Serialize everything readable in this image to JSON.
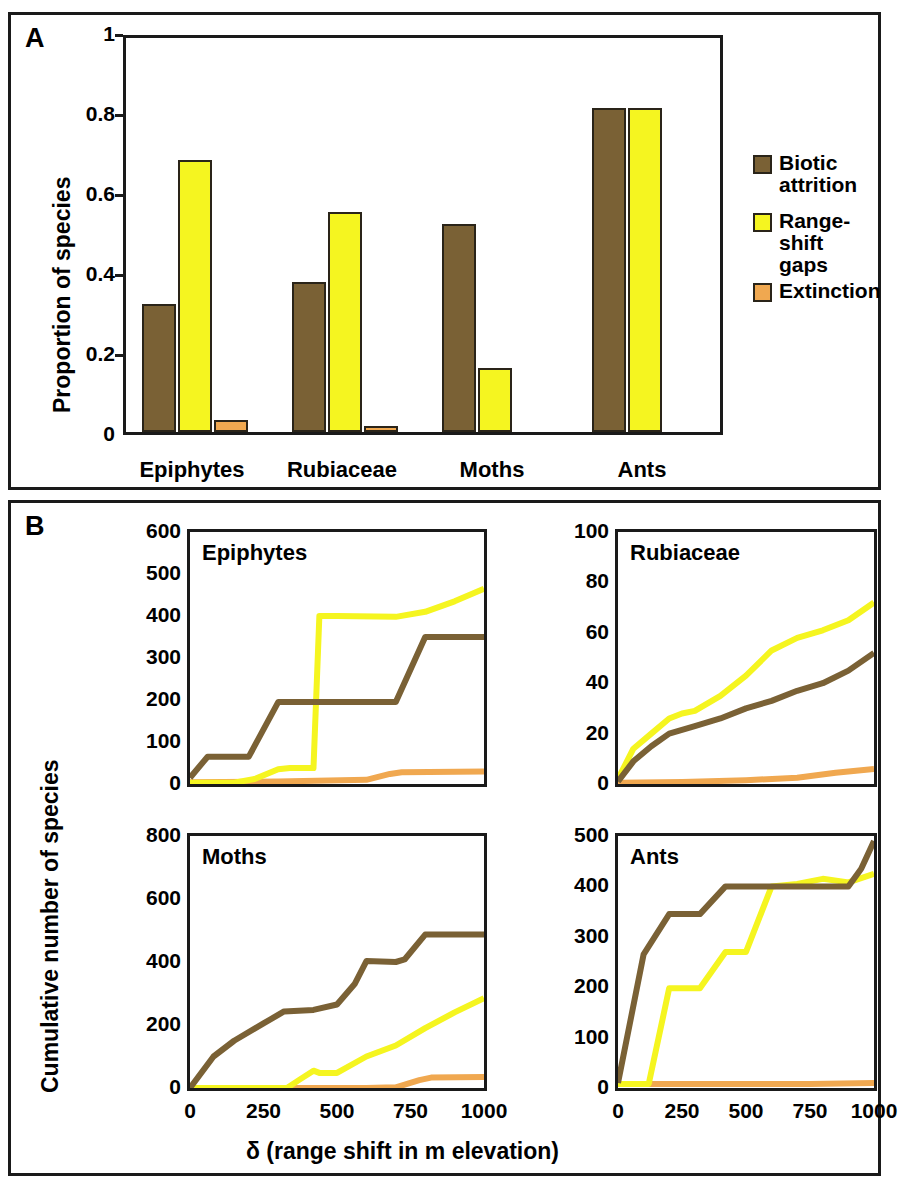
{
  "figure": {
    "panel_a_letter": "A",
    "panel_b_letter": "B"
  },
  "colors": {
    "biotic_attrition": "#7a6135",
    "range_shift_gaps": "#f5f520",
    "extinction": "#f0a850",
    "outline": "#2a2419",
    "axis": "#1a1a1a"
  },
  "legend": {
    "items": [
      {
        "label": "Biotic\nattrition",
        "color_key": "biotic_attrition"
      },
      {
        "label": "Range-shift\ngaps",
        "color_key": "range_shift_gaps"
      },
      {
        "label": "Extinction",
        "color_key": "extinction"
      }
    ]
  },
  "panel_a": {
    "ylabel": "Proportion of species",
    "yticks": [
      "0",
      "0.2",
      "0.4",
      "0.6",
      "0.8",
      "1"
    ],
    "categories": [
      "Epiphytes",
      "Rubiaceae",
      "Moths",
      "Ants"
    ]
  },
  "panel_b": {
    "ylabel": "Cumulative number of species",
    "xlabel": "δ (range shift in m elevation)",
    "subplots": [
      {
        "title": "Epiphytes",
        "yticks": [
          "0",
          "100",
          "200",
          "300",
          "400",
          "500",
          "600"
        ],
        "xticks": [
          "0",
          "250",
          "500",
          "750",
          "1000"
        ],
        "show_xticks": false
      },
      {
        "title": "Rubiaceae",
        "yticks": [
          "0",
          "20",
          "40",
          "60",
          "80",
          "100"
        ],
        "xticks": [
          "0",
          "250",
          "500",
          "750",
          "1000"
        ],
        "show_xticks": false
      },
      {
        "title": "Moths",
        "yticks": [
          "0",
          "200",
          "400",
          "600",
          "800"
        ],
        "xticks": [
          "0",
          "250",
          "500",
          "750",
          "1000"
        ],
        "show_xticks": true
      },
      {
        "title": "Ants",
        "yticks": [
          "0",
          "100",
          "200",
          "300",
          "400",
          "500"
        ],
        "xticks": [
          "0",
          "250",
          "500",
          "750",
          "1000"
        ],
        "show_xticks": true
      }
    ]
  },
  "chart_data": [
    {
      "type": "bar",
      "panel": "A",
      "title": "",
      "xlabel": "",
      "ylabel": "Proportion of species",
      "ylim": [
        0,
        1
      ],
      "yticks": [
        0,
        0.2,
        0.4,
        0.6,
        0.8,
        1
      ],
      "grid": false,
      "legend_position": "right",
      "categories": [
        "Epiphytes",
        "Rubiaceae",
        "Moths",
        "Ants"
      ],
      "series": [
        {
          "name": "Biotic attrition",
          "color": "#7a6135",
          "values": [
            0.32,
            0.375,
            0.52,
            0.81
          ]
        },
        {
          "name": "Range-shift gaps",
          "color": "#f5f520",
          "values": [
            0.68,
            0.55,
            0.16,
            0.81
          ]
        },
        {
          "name": "Extinction",
          "color": "#f0a850",
          "values": [
            0.03,
            0.015,
            0.0,
            0.0
          ]
        }
      ]
    },
    {
      "type": "line",
      "panel": "B",
      "title": "Epiphytes",
      "xlabel": "δ (range shift in m elevation)",
      "ylabel": "Cumulative number of species",
      "xlim": [
        0,
        1000
      ],
      "ylim": [
        0,
        600
      ],
      "xticks": [
        0,
        250,
        500,
        750,
        1000
      ],
      "yticks": [
        0,
        100,
        200,
        300,
        400,
        500,
        600
      ],
      "grid": false,
      "series": [
        {
          "name": "Biotic attrition",
          "color": "#7a6135",
          "x": [
            0,
            60,
            110,
            200,
            300,
            320,
            420,
            700,
            800,
            1000
          ],
          "values": [
            15,
            65,
            65,
            65,
            195,
            195,
            195,
            195,
            350,
            350
          ]
        },
        {
          "name": "Range-shift gaps",
          "color": "#f5f520",
          "x": [
            0,
            150,
            220,
            300,
            340,
            420,
            440,
            500,
            700,
            800,
            900,
            1000
          ],
          "values": [
            3,
            3,
            12,
            35,
            38,
            38,
            400,
            400,
            398,
            410,
            435,
            465
          ]
        },
        {
          "name": "Extinction",
          "color": "#f0a850",
          "x": [
            0,
            300,
            600,
            680,
            720,
            1000
          ],
          "values": [
            4,
            6,
            10,
            24,
            28,
            30
          ]
        }
      ]
    },
    {
      "type": "line",
      "panel": "B",
      "title": "Rubiaceae",
      "xlabel": "δ (range shift in m elevation)",
      "ylabel": "Cumulative number of species",
      "xlim": [
        0,
        1000
      ],
      "ylim": [
        0,
        100
      ],
      "xticks": [
        0,
        250,
        500,
        750,
        1000
      ],
      "yticks": [
        0,
        20,
        40,
        60,
        80,
        100
      ],
      "grid": false,
      "series": [
        {
          "name": "Biotic attrition",
          "color": "#7a6135",
          "x": [
            0,
            60,
            130,
            200,
            300,
            400,
            500,
            600,
            700,
            800,
            900,
            1000
          ],
          "values": [
            1,
            9,
            15,
            20,
            23,
            26,
            30,
            33,
            37,
            40,
            45,
            52
          ]
        },
        {
          "name": "Range-shift gaps",
          "color": "#f5f520",
          "x": [
            0,
            60,
            130,
            200,
            250,
            300,
            400,
            500,
            600,
            700,
            800,
            900,
            1000
          ],
          "values": [
            2,
            14,
            20,
            26,
            28,
            29,
            35,
            43,
            53,
            58,
            61,
            65,
            72
          ]
        },
        {
          "name": "Extinction",
          "color": "#f0a850",
          "x": [
            0,
            250,
            500,
            700,
            850,
            1000
          ],
          "values": [
            0.5,
            0.8,
            1.5,
            2.5,
            4.5,
            6
          ]
        }
      ]
    },
    {
      "type": "line",
      "panel": "B",
      "title": "Moths",
      "xlabel": "δ (range shift in m elevation)",
      "ylabel": "Cumulative number of species",
      "xlim": [
        0,
        1000
      ],
      "ylim": [
        0,
        800
      ],
      "xticks": [
        0,
        250,
        500,
        750,
        1000
      ],
      "yticks": [
        0,
        200,
        400,
        600,
        800
      ],
      "grid": false,
      "series": [
        {
          "name": "Biotic attrition",
          "color": "#7a6135",
          "x": [
            0,
            80,
            150,
            250,
            320,
            420,
            500,
            560,
            600,
            700,
            730,
            800,
            1000
          ],
          "values": [
            0,
            100,
            150,
            205,
            243,
            248,
            265,
            330,
            403,
            400,
            408,
            487,
            487
          ]
        },
        {
          "name": "Range-shift gaps",
          "color": "#f5f520",
          "x": [
            0,
            330,
            370,
            420,
            440,
            500,
            600,
            700,
            800,
            900,
            1000
          ],
          "values": [
            0,
            0,
            25,
            55,
            48,
            48,
            100,
            135,
            190,
            240,
            285
          ]
        },
        {
          "name": "Extinction",
          "color": "#f0a850",
          "x": [
            0,
            600,
            700,
            780,
            820,
            1000
          ],
          "values": [
            0,
            0,
            2,
            25,
            33,
            35
          ]
        }
      ]
    },
    {
      "type": "line",
      "panel": "B",
      "title": "Ants",
      "xlabel": "δ (range shift in m elevation)",
      "ylabel": "Cumulative number of species",
      "xlim": [
        0,
        1000
      ],
      "ylim": [
        0,
        500
      ],
      "xticks": [
        0,
        250,
        500,
        750,
        1000
      ],
      "yticks": [
        0,
        100,
        200,
        300,
        400,
        500
      ],
      "grid": false,
      "series": [
        {
          "name": "Biotic attrition",
          "color": "#7a6135",
          "x": [
            0,
            100,
            200,
            320,
            420,
            600,
            700,
            800,
            900,
            950,
            1000
          ],
          "values": [
            10,
            265,
            345,
            345,
            400,
            400,
            400,
            400,
            400,
            435,
            490
          ]
        },
        {
          "name": "Range-shift gaps",
          "color": "#f5f520",
          "x": [
            0,
            120,
            200,
            320,
            420,
            500,
            600,
            700,
            800,
            900,
            1000
          ],
          "values": [
            8,
            8,
            198,
            198,
            270,
            270,
            400,
            405,
            415,
            408,
            425
          ]
        },
        {
          "name": "Extinction",
          "color": "#f0a850",
          "x": [
            0,
            250,
            500,
            750,
            1000
          ],
          "values": [
            8,
            8,
            8,
            8,
            10
          ]
        }
      ]
    }
  ]
}
